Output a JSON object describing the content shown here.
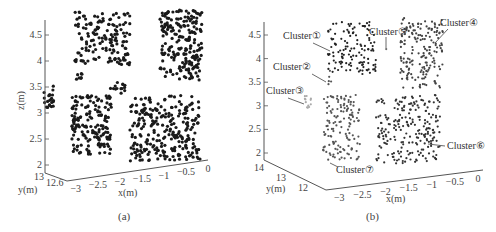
{
  "figure": {
    "panels": [
      {
        "id": "a",
        "caption": "(a)"
      },
      {
        "id": "b",
        "caption": "(b)"
      }
    ]
  },
  "chart_data": [
    {
      "type": "scatter",
      "subtype": "3d-point-cloud",
      "title": "",
      "caption": "(a)",
      "xlabel": "x(m)",
      "ylabel": "y(m)",
      "zlabel": "z(m)",
      "x_ticks": [
        "-3",
        "-2.5",
        "-2",
        "-1.5",
        "-1",
        "-0.5",
        "0"
      ],
      "y_ticks": [
        "13",
        "12.6"
      ],
      "z_ticks": [
        "2",
        "2.5",
        "3",
        "3.5",
        "4",
        "4.5"
      ],
      "xlim": [
        -3.2,
        0
      ],
      "ylim": [
        12.6,
        13
      ],
      "zlim": [
        1.9,
        4.8
      ],
      "grid": false,
      "point_color": "#1a1a1a",
      "regions": [
        {
          "name": "upper-left structure",
          "x_range": [
            -3.0,
            -1.9
          ],
          "z_range": [
            3.6,
            4.8
          ]
        },
        {
          "name": "upper-right block",
          "x_range": [
            -1.0,
            -0.2
          ],
          "z_range": [
            3.7,
            4.8
          ]
        },
        {
          "name": "left edge fragment",
          "x_range": [
            -3.2,
            -3.1
          ],
          "z_range": [
            3.1,
            3.5
          ]
        },
        {
          "name": "lower-left structure",
          "x_range": [
            -2.9,
            -2.0
          ],
          "z_range": [
            2.0,
            3.5
          ]
        },
        {
          "name": "lower-right block",
          "x_range": [
            -1.6,
            0.0
          ],
          "z_range": [
            2.0,
            3.3
          ]
        }
      ]
    },
    {
      "type": "scatter",
      "subtype": "3d-point-cloud",
      "title": "",
      "caption": "(b)",
      "xlabel": "x(m)",
      "ylabel": "y(m)",
      "zlabel": "z(m)",
      "x_ticks": [
        "-3",
        "-2.5",
        "-2",
        "-1.5",
        "-1",
        "-0.5",
        "0"
      ],
      "y_ticks": [
        "14",
        "13",
        "12"
      ],
      "z_ticks": [
        "2",
        "2.5",
        "3",
        "3.5",
        "4",
        "4.5"
      ],
      "xlim": [
        -3.2,
        0
      ],
      "ylim": [
        12,
        14
      ],
      "zlim": [
        1.9,
        4.8
      ],
      "grid": false,
      "annotations": [
        {
          "label": "Cluster①",
          "target": "upper-left structure"
        },
        {
          "label": "Cluster②",
          "target": "small sparse group left"
        },
        {
          "label": "Cluster③",
          "target": "light grey fragment left"
        },
        {
          "label": "Cluster④",
          "target": "upper-right block"
        },
        {
          "label": "Cluster⑤",
          "target": "isolated point between upper clusters"
        },
        {
          "label": "Cluster⑥",
          "target": "lower-right block"
        },
        {
          "label": "Cluster⑦",
          "target": "lower-left structure"
        }
      ],
      "series": [
        {
          "name": "Cluster①",
          "color": "#222222",
          "x_range": [
            -3.0,
            -1.9
          ],
          "z_range": [
            3.6,
            4.8
          ]
        },
        {
          "name": "Cluster②",
          "color": "#555555",
          "x_range": [
            -3.1,
            -3.0
          ],
          "z_range": [
            3.3,
            3.8
          ]
        },
        {
          "name": "Cluster③",
          "color": "#aaaaaa",
          "x_range": [
            -3.2,
            -3.1
          ],
          "z_range": [
            2.9,
            3.3
          ]
        },
        {
          "name": "Cluster④",
          "color": "#444444",
          "x_range": [
            -1.0,
            -0.2
          ],
          "z_range": [
            3.6,
            4.8
          ]
        },
        {
          "name": "Cluster⑤",
          "color": "#666666",
          "x_range": [
            -1.6,
            -1.5
          ],
          "z_range": [
            4.1,
            4.2
          ]
        },
        {
          "name": "Cluster⑥",
          "color": "#333333",
          "x_range": [
            -1.6,
            0.0
          ],
          "z_range": [
            2.0,
            3.3
          ]
        },
        {
          "name": "Cluster⑦",
          "color": "#555555",
          "x_range": [
            -2.9,
            -2.0
          ],
          "z_range": [
            2.0,
            3.5
          ]
        }
      ]
    }
  ]
}
